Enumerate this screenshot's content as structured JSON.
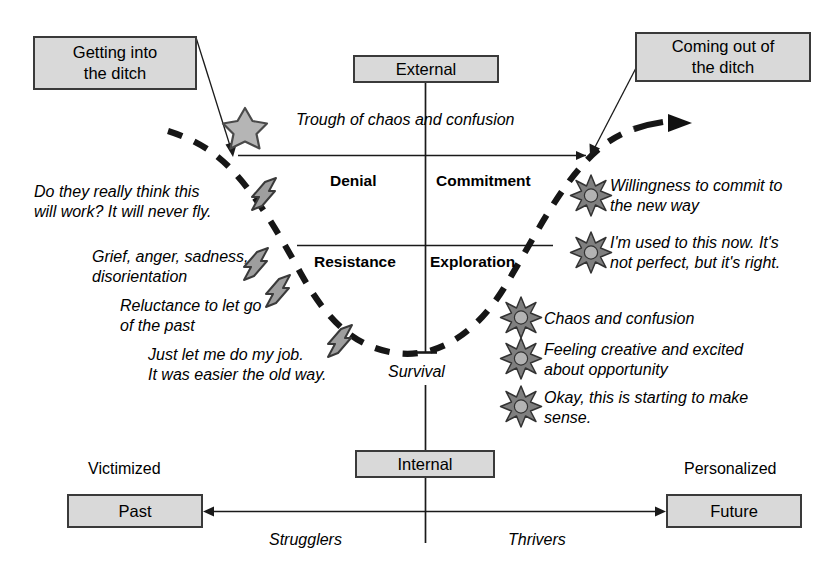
{
  "diagram": {
    "title_boxes": {
      "getting_in": "Getting into\nthe ditch",
      "coming_out": "Coming out of\nthe ditch"
    },
    "axis_boxes": {
      "external": "External",
      "internal": "Internal",
      "past": "Past",
      "future": "Future"
    },
    "axis_captions": {
      "victimized": "Victimized",
      "personalized": "Personalized",
      "strugglers": "Strugglers",
      "thrivers": "Thrivers"
    },
    "curve_labels": {
      "trough": "Trough of chaos and confusion",
      "survival": "Survival"
    },
    "quadrants": {
      "top_left": "Denial",
      "top_right": "Commitment",
      "bottom_left": "Resistance",
      "bottom_right": "Exploration"
    },
    "left_statements": [
      "Do they really think this\nwill work? It will never fly.",
      "Grief, anger, sadness,\ndisorientation",
      "Reluctance to let go\nof the past",
      "Just let me do my job.\nIt was easier the old way."
    ],
    "right_statements": [
      "Willingness to commit to\nthe new way",
      "I'm used to this now. It's\nnot perfect, but it's right.",
      "Chaos and confusion",
      "Feeling creative and excited\nabout opportunity",
      "Okay, this is starting to make\nsense."
    ],
    "icons": {
      "star": "star-icon",
      "bolt": "lightning-bolt-icon",
      "burst": "starburst-icon"
    },
    "colors": {
      "box_fill": "#d9d9d9",
      "box_border": "#3a3a3a",
      "icon_fill": "#a8a8a8",
      "icon_stroke": "#444444",
      "line": "#1a1a1a",
      "text": "#000000"
    }
  }
}
